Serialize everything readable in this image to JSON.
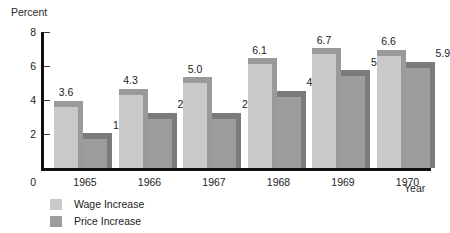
{
  "chart_data": {
    "type": "bar",
    "title": "",
    "subtitle": "",
    "xlabel": "Year",
    "ylabel": "Percent",
    "categories": [
      "1965",
      "1966",
      "1967",
      "1968",
      "1969",
      "1970"
    ],
    "series": [
      {
        "name": "Wage Increase",
        "color": "#c9c9c9",
        "cap_color": "#9a9a9a",
        "values": [
          3.6,
          4.3,
          5.0,
          6.1,
          6.7,
          6.6
        ],
        "labels": [
          "3.6",
          "4.3",
          "5.0",
          "6.1",
          "6.7",
          "6.6"
        ]
      },
      {
        "name": "Price Increase",
        "color": "#9d9d9d",
        "cap_color": "#7b7b7b",
        "values": [
          1.7,
          2.9,
          2.9,
          4.2,
          5.4,
          5.9
        ],
        "labels": [
          "1.7",
          "2.9",
          "2.9",
          "4.2",
          "5.4",
          "5.9"
        ]
      }
    ],
    "ylim": [
      0,
      8
    ],
    "yticks": [
      2,
      4,
      6,
      8
    ],
    "ytick_labels": [
      "2",
      "4",
      "6",
      "8"
    ],
    "zero_label": "0",
    "grid": false,
    "legend_position": "bottom-left"
  },
  "legend": {
    "items": [
      {
        "label": "Wage Increase",
        "color": "#c9c9c9"
      },
      {
        "label": "Price Increase",
        "color": "#9d9d9d"
      }
    ]
  },
  "axis": {
    "y_title": "Percent",
    "x_title": "Year",
    "axis_color": "#101010"
  }
}
